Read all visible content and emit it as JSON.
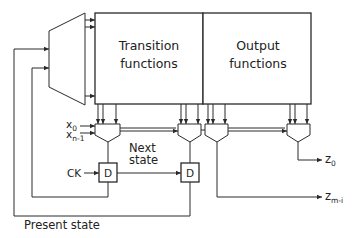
{
  "diagram": {
    "type": "sequential-circuit-block-diagram",
    "blocks": {
      "transition": {
        "line1": "Transition",
        "line2": "functions"
      },
      "output": {
        "line1": "Output",
        "line2": "functions"
      },
      "decoder": "decoder"
    },
    "labels": {
      "x0": "x",
      "x0_sub": "0",
      "xn1": "x",
      "xn1_sub": "n-1",
      "next_state_1": "Next",
      "next_state_2": "state",
      "ck": "CK",
      "d1": "D",
      "d2": "D",
      "present_state": "Present  state",
      "z0": "z",
      "z0_sub": "0",
      "zm": "z",
      "zm_sub": "m-i"
    },
    "colors": {
      "line": "#2a2a2a",
      "text": "#222222",
      "background": "#ffffff"
    }
  }
}
